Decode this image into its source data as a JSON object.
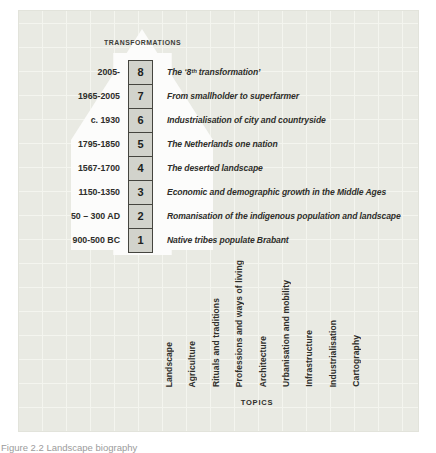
{
  "figure": {
    "caption": "Figure 2.2 Landscape biography"
  },
  "transformations": {
    "title": "TRANSFORMATIONS",
    "rows": [
      {
        "number": "8",
        "period": "2005-",
        "label": "The ‘8ᵗʰ transformation’"
      },
      {
        "number": "7",
        "period": "1965-2005",
        "label": "From smallholder to superfarmer"
      },
      {
        "number": "6",
        "period": "c. 1930",
        "label": "Industrialisation of city and countryside"
      },
      {
        "number": "5",
        "period": "1795-1850",
        "label": "The Netherlands one nation"
      },
      {
        "number": "4",
        "period": "1567-1700",
        "label": "The deserted landscape"
      },
      {
        "number": "3",
        "period": "1150-1350",
        "label": "Economic and demographic growth in the Middle Ages"
      },
      {
        "number": "2",
        "period": "50 – 300 AD",
        "label": "Romanisation of the indigenous population and landscape"
      },
      {
        "number": "1",
        "period": "900-500 BC",
        "label": "Native tribes populate Brabant"
      }
    ]
  },
  "topics": {
    "title": "TOPICS",
    "items": [
      "Landscape",
      "Agriculture",
      "Rituals and traditions",
      "Professions and ways of living",
      "Architecture",
      "Urbanisation and mobility",
      "Infrastructure",
      "Industrialisation",
      "Cartography"
    ]
  },
  "colors": {
    "panel_background": "#e9eae3",
    "grid_line": "#f4f5ef",
    "arrow_white": "#fcfcfb",
    "number_box_fill": "#d2d3cc",
    "number_box_border": "#45453f",
    "text": "#2e2e2a",
    "caption_text": "#9b9b9b"
  }
}
